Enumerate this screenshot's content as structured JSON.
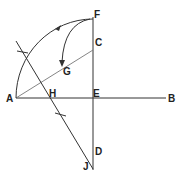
{
  "diagram": {
    "labels": {
      "A": "A",
      "B": "B",
      "C": "C",
      "D": "D",
      "E": "E",
      "F": "F",
      "G": "G",
      "H": "H",
      "J": "J"
    },
    "colors": {
      "line": "#333333",
      "light_line": "#777777",
      "text": "#222222",
      "background": "#ffffff"
    }
  }
}
